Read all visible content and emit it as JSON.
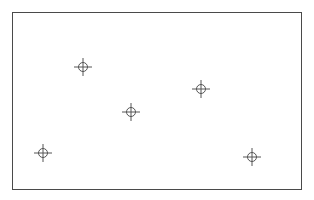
{
  "diagram": {
    "frame": {
      "x": 12,
      "y": 12,
      "width": 290,
      "height": 178,
      "border_color": "#4a4a4a"
    },
    "marker_style": {
      "icon": "crosshair-circle-icon",
      "circle_radius": 4.5,
      "arm_length": 9,
      "stroke_color": "#555555"
    },
    "markers": [
      {
        "id": "marker-1",
        "x": 83,
        "y": 67
      },
      {
        "id": "marker-2",
        "x": 43,
        "y": 153
      },
      {
        "id": "marker-3",
        "x": 131,
        "y": 112
      },
      {
        "id": "marker-4",
        "x": 201,
        "y": 89
      },
      {
        "id": "marker-5",
        "x": 252,
        "y": 157
      }
    ]
  }
}
